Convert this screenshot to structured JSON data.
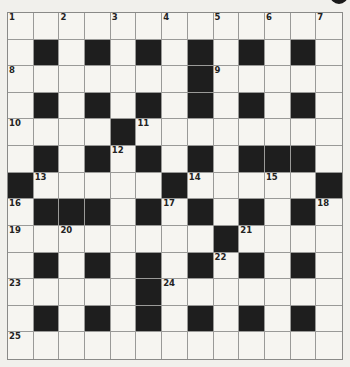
{
  "puzzle": {
    "type": "crossword",
    "rows": 13,
    "cols": 13,
    "colors": {
      "black": "#1e1e1e",
      "white": "#f6f5f1",
      "line": "#9a9a98"
    },
    "grid": [
      ".............",
      ".#.#.#.#.#.#.",
      ".......#.....",
      ".#.#.#.#.#.#.",
      "....#........",
      ".#.#.#.#.###.",
      "#.....#.....#",
      ".###.#.#.#.#.",
      "........#....",
      ".#.#.#.#.#.#.",
      ".....#.......",
      ".#.#.#.#.#.#.",
      "............."
    ],
    "numbers": [
      {
        "r": 0,
        "c": 0,
        "n": "1"
      },
      {
        "r": 0,
        "c": 2,
        "n": "2"
      },
      {
        "r": 0,
        "c": 4,
        "n": "3"
      },
      {
        "r": 0,
        "c": 6,
        "n": "4"
      },
      {
        "r": 0,
        "c": 8,
        "n": "5"
      },
      {
        "r": 0,
        "c": 10,
        "n": "6"
      },
      {
        "r": 0,
        "c": 12,
        "n": "7"
      },
      {
        "r": 2,
        "c": 0,
        "n": "8"
      },
      {
        "r": 2,
        "c": 8,
        "n": "9"
      },
      {
        "r": 4,
        "c": 0,
        "n": "10"
      },
      {
        "r": 4,
        "c": 5,
        "n": "11"
      },
      {
        "r": 5,
        "c": 4,
        "n": "12"
      },
      {
        "r": 6,
        "c": 1,
        "n": "13"
      },
      {
        "r": 6,
        "c": 7,
        "n": "14"
      },
      {
        "r": 6,
        "c": 10,
        "n": "15"
      },
      {
        "r": 7,
        "c": 0,
        "n": "16"
      },
      {
        "r": 7,
        "c": 6,
        "n": "17"
      },
      {
        "r": 7,
        "c": 12,
        "n": "18"
      },
      {
        "r": 8,
        "c": 0,
        "n": "19"
      },
      {
        "r": 8,
        "c": 2,
        "n": "20"
      },
      {
        "r": 8,
        "c": 9,
        "n": "21"
      },
      {
        "r": 9,
        "c": 8,
        "n": "22"
      },
      {
        "r": 10,
        "c": 0,
        "n": "23"
      },
      {
        "r": 10,
        "c": 6,
        "n": "24"
      },
      {
        "r": 12,
        "c": 0,
        "n": "25"
      }
    ]
  }
}
